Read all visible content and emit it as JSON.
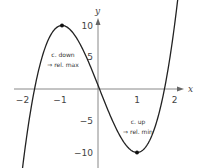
{
  "chart_data": {
    "type": "line",
    "title": "",
    "function": "f(x) = 5x^3 - 15x",
    "xlabel": "x",
    "ylabel": "y",
    "xlim": [
      -2.3,
      2.2
    ],
    "ylim": [
      -12.5,
      11.5
    ],
    "grid": false,
    "x_ticks": [
      -2,
      -1,
      1,
      2
    ],
    "x_tick_labels": [
      "−2",
      "−1",
      "1",
      "2"
    ],
    "y_ticks": [
      10,
      5,
      -5,
      -10
    ],
    "y_tick_labels": [
      "10",
      "5",
      "−5",
      "−10"
    ],
    "series": [
      {
        "name": "f(x)",
        "color": "#222222",
        "x": [
          -2.3,
          -2,
          -1.5,
          -1,
          -0.5,
          0,
          0.5,
          1,
          1.5,
          2,
          2.2
        ],
        "y": [
          -26.3,
          -10,
          5.6,
          10,
          6.9,
          0,
          -6.9,
          -10,
          -5.6,
          10,
          20.2
        ]
      }
    ],
    "points": [
      {
        "name": "relative maximum",
        "x": -1,
        "y": 10
      },
      {
        "name": "relative minimum",
        "x": 1,
        "y": -10
      }
    ],
    "annotations": [
      {
        "line1": "c. down",
        "line2": "⇒ rel. max",
        "near": "relative maximum"
      },
      {
        "line1": "c. up",
        "line2": "⇒ rel. min",
        "near": "relative minimum"
      }
    ]
  }
}
